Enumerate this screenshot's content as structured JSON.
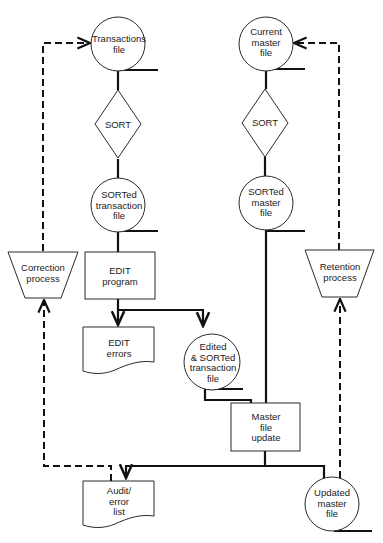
{
  "diagram": {
    "type": "system flowchart",
    "nodes": {
      "transactions_file": {
        "shape": "storage-circle",
        "lines": [
          "Transactions",
          "file"
        ]
      },
      "current_master_file": {
        "shape": "storage-circle",
        "lines": [
          "Current",
          "master",
          "file"
        ]
      },
      "sort_left": {
        "shape": "diamond",
        "lines": [
          "SORT"
        ]
      },
      "sort_right": {
        "shape": "diamond",
        "lines": [
          "SORT"
        ]
      },
      "sorted_transaction_file": {
        "shape": "storage-circle",
        "lines": [
          "SORTed",
          "transaction",
          "file"
        ]
      },
      "sorted_master_file": {
        "shape": "storage-circle",
        "lines": [
          "SORTed",
          "master",
          "file"
        ]
      },
      "correction_process": {
        "shape": "manual-operation-trapezoid",
        "lines": [
          "Correction",
          "process"
        ]
      },
      "retention_process": {
        "shape": "manual-operation-trapezoid",
        "lines": [
          "Retention",
          "process"
        ]
      },
      "edit_program": {
        "shape": "process-rect",
        "lines": [
          "EDIT",
          "program"
        ]
      },
      "edit_errors": {
        "shape": "document",
        "lines": [
          "EDIT",
          "errors"
        ]
      },
      "edited_sorted_transaction_file": {
        "shape": "storage-circle",
        "lines": [
          "Edited",
          "& SORTed",
          "transaction",
          "file"
        ]
      },
      "master_file_update": {
        "shape": "process-rect",
        "lines": [
          "Master",
          "file",
          "update"
        ]
      },
      "audit_error_list": {
        "shape": "document",
        "lines": [
          "Audit/",
          "error",
          "list"
        ]
      },
      "updated_master_file": {
        "shape": "storage-circle",
        "lines": [
          "Updated",
          "master",
          "file"
        ]
      }
    },
    "edges": [
      {
        "from": "transactions_file",
        "to": "sort_left",
        "style": "solid"
      },
      {
        "from": "sort_left",
        "to": "sorted_transaction_file",
        "style": "solid"
      },
      {
        "from": "sorted_transaction_file",
        "to": "edit_program",
        "style": "solid"
      },
      {
        "from": "edit_program",
        "to": "edit_errors",
        "style": "solid-arrow"
      },
      {
        "from": "edit_program",
        "to": "edited_sorted_transaction_file",
        "style": "solid-arrow"
      },
      {
        "from": "edited_sorted_transaction_file",
        "to": "master_file_update",
        "style": "solid"
      },
      {
        "from": "current_master_file",
        "to": "sort_right",
        "style": "solid"
      },
      {
        "from": "sort_right",
        "to": "sorted_master_file",
        "style": "solid"
      },
      {
        "from": "sorted_master_file",
        "to": "master_file_update",
        "style": "solid"
      },
      {
        "from": "master_file_update",
        "to": "audit_error_list",
        "style": "solid-arrow"
      },
      {
        "from": "master_file_update",
        "to": "updated_master_file",
        "style": "solid"
      },
      {
        "from": "audit_error_list",
        "to": "correction_process",
        "style": "dashed-arrow"
      },
      {
        "from": "correction_process",
        "to": "transactions_file",
        "style": "dashed-arrow"
      },
      {
        "from": "updated_master_file",
        "to": "retention_process",
        "style": "dashed-arrow"
      },
      {
        "from": "retention_process",
        "to": "current_master_file",
        "style": "dashed-arrow"
      }
    ]
  }
}
